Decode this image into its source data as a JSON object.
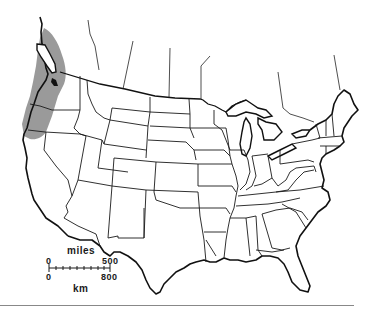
{
  "map": {
    "title": "",
    "region": "Contiguous United States and southern Canada",
    "highlighted_range": {
      "description": "Pacific Northwest coastal range (shaded)",
      "areas": [
        "Vancouver Island",
        "Coastal British Columbia",
        "Western Washington",
        "Western Oregon",
        "Northwestern California"
      ],
      "fill_color": "#9a9a9a"
    },
    "line_color": "#1a1a1a",
    "background_color": "#ffffff"
  },
  "scale_bar": {
    "top_unit": "miles",
    "top_start": "0",
    "top_end": "500",
    "bottom_unit": "km",
    "bottom_start": "0",
    "bottom_end": "800"
  },
  "footer_rule_color": "#888888"
}
